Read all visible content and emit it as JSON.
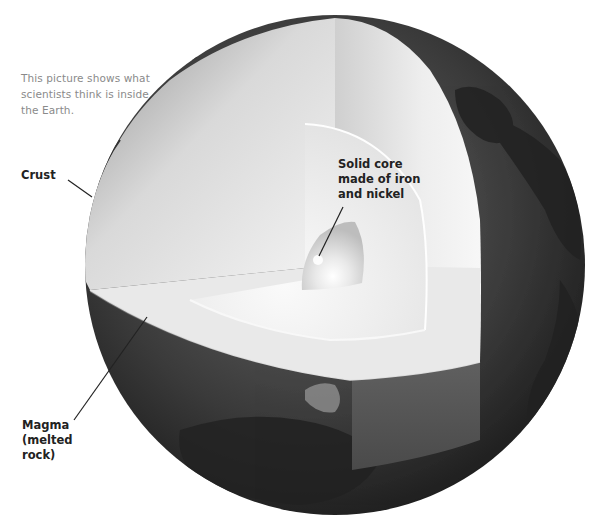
{
  "figure": {
    "intro_text": "This picture shows what scientists think is inside the Earth.",
    "labels": {
      "crust": "Crust",
      "core": "Solid core\nmade of iron\nand nickel",
      "magma": "Magma\n(melted\nrock)"
    }
  },
  "globe": {
    "center_x": 335,
    "center_y": 265,
    "radius": 250,
    "colors": {
      "surface_dark": "#1a1a1a",
      "surface_mid": "#4a4a4a",
      "mantle_light": "#e6e6e6",
      "mantle_shadow": "#9a9a9a",
      "outer_core": "#f2f2f2",
      "inner_core": "#d8d8d8",
      "magma_band": "#5a5a5a",
      "leader_line": "#222222"
    }
  }
}
